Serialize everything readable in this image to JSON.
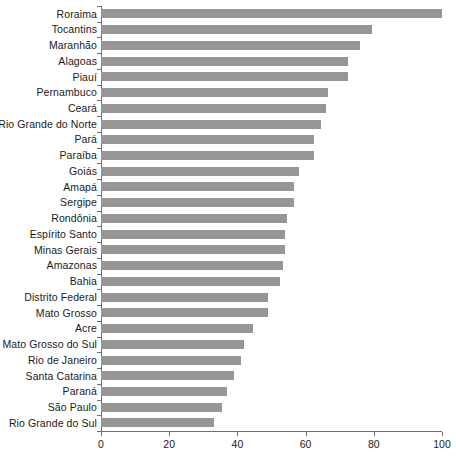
{
  "chart_data": {
    "type": "bar",
    "orientation": "horizontal",
    "title": "",
    "subtitle": "",
    "xlabel": "",
    "ylabel": "",
    "xlim": [
      0,
      100
    ],
    "xticks": [
      0,
      20,
      40,
      60,
      80,
      100
    ],
    "xtick_labels": [
      "0",
      "20",
      "40",
      "60",
      "80",
      "100"
    ],
    "grid": false,
    "legend": null,
    "bar_color": "#969696",
    "axis_color": "#6e6e6e",
    "categories": [
      "Roraima",
      "Tocantins",
      "Maranhão",
      "Alagoas",
      "Piauí",
      "Pernambuco",
      "Ceará",
      "Rio Grande do Norte",
      "Pará",
      "Paraíba",
      "Goiás",
      "Amapá",
      "Sergipe",
      "Rondônia",
      "Espírito Santo",
      "Minas Gerais",
      "Amazonas",
      "Bahia",
      "Distrito Federal",
      "Mato Grosso",
      "Acre",
      "Mato Grosso do Sul",
      "Rio de Janeiro",
      "Santa Catarina",
      "Paraná",
      "São Paulo",
      "Rio Grande do Sul"
    ],
    "values": [
      100.0,
      79.5,
      76.0,
      72.5,
      72.5,
      66.5,
      66.0,
      64.5,
      62.5,
      62.5,
      58.0,
      56.5,
      56.5,
      54.5,
      54.0,
      54.0,
      53.5,
      52.5,
      49.0,
      49.0,
      44.5,
      42.0,
      41.0,
      39.0,
      37.0,
      35.5,
      33.0
    ]
  }
}
